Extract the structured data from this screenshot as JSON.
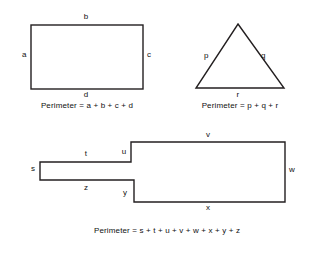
{
  "page": {
    "background_color": "#ffffff",
    "stroke_color": "#231f20",
    "text_color": "#111111"
  },
  "figures": [
    {
      "id": "rectangle",
      "name": "rectangle-figure",
      "shape": "rectangle",
      "labels": [
        {
          "id": "a",
          "text": "a",
          "x": 22,
          "y": 55
        },
        {
          "id": "b",
          "text": "b",
          "x": 86,
          "y": 17
        },
        {
          "id": "c",
          "text": "c",
          "x": 150,
          "y": 55
        },
        {
          "id": "d",
          "text": "d",
          "x": 86,
          "y": 95
        }
      ],
      "formula": {
        "text": "Perimeter = a + b + c + d",
        "x": 87,
        "y": 106
      }
    },
    {
      "id": "triangle",
      "name": "triangle-figure",
      "shape": "triangle",
      "labels": [
        {
          "id": "p",
          "text": "p",
          "x": 206,
          "y": 56
        },
        {
          "id": "q",
          "text": "q",
          "x": 263,
          "y": 56
        },
        {
          "id": "r",
          "text": "r",
          "x": 238,
          "y": 95
        }
      ],
      "formula": {
        "text": "Perimeter = p + q + r",
        "x": 240,
        "y": 106
      }
    },
    {
      "id": "polygon",
      "name": "step-polygon-figure",
      "shape": "polygon",
      "labels": [
        {
          "id": "s",
          "text": "s",
          "x": 32,
          "y": 167
        },
        {
          "id": "t",
          "text": "t",
          "x": 86,
          "y": 153
        },
        {
          "id": "u",
          "text": "u",
          "x": 124,
          "y": 151
        },
        {
          "id": "v",
          "text": "v",
          "x": 208,
          "y": 135
        },
        {
          "id": "w",
          "text": "w",
          "x": 290,
          "y": 169
        },
        {
          "id": "x",
          "text": "x",
          "x": 208,
          "y": 206
        },
        {
          "id": "y",
          "text": "y",
          "x": 125,
          "y": 192
        },
        {
          "id": "z",
          "text": "z",
          "x": 86,
          "y": 186
        }
      ],
      "formula": {
        "text": "Perimeter =  s + t + u + v + w + x + y + z",
        "x": 167,
        "y": 231
      }
    }
  ]
}
